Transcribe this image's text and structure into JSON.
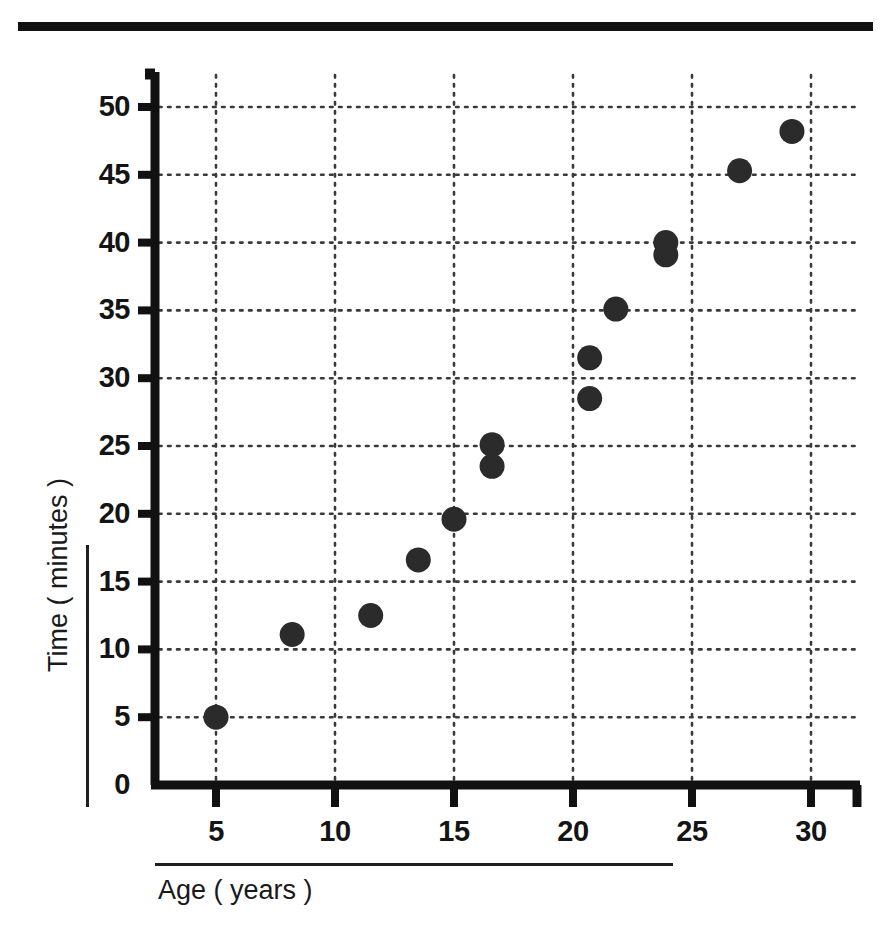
{
  "page": {
    "top_rule": "horizontal-rule"
  },
  "chart_data": {
    "type": "scatter",
    "title": "",
    "xlabel": "Age ( years )",
    "ylabel": "Time ( minutes )",
    "xlim": [
      3,
      32.5
    ],
    "ylim": [
      0,
      52.5
    ],
    "xticks": [
      5,
      10,
      15,
      20,
      25,
      30
    ],
    "yticks": [
      0,
      5,
      10,
      15,
      20,
      25,
      30,
      35,
      40,
      45,
      50
    ],
    "grid": true,
    "grid_style": "dotted",
    "legend": "none",
    "marker_color": "#2b2b2b",
    "axis_color": "#111111",
    "points": [
      {
        "x": 5.0,
        "y": 5.0
      },
      {
        "x": 8.2,
        "y": 11.1
      },
      {
        "x": 11.5,
        "y": 12.5
      },
      {
        "x": 13.5,
        "y": 16.6
      },
      {
        "x": 15.0,
        "y": 19.6
      },
      {
        "x": 16.6,
        "y": 25.1
      },
      {
        "x": 16.6,
        "y": 23.5
      },
      {
        "x": 20.7,
        "y": 28.5
      },
      {
        "x": 20.7,
        "y": 31.5
      },
      {
        "x": 21.8,
        "y": 35.1
      },
      {
        "x": 23.9,
        "y": 40.0
      },
      {
        "x": 23.9,
        "y": 39.1
      },
      {
        "x": 27.0,
        "y": 45.3
      },
      {
        "x": 29.2,
        "y": 48.2
      }
    ],
    "x": [
      5.0,
      8.2,
      11.5,
      13.5,
      15.0,
      16.6,
      16.6,
      20.7,
      20.7,
      21.8,
      23.9,
      23.9,
      27.0,
      29.2
    ],
    "values": [
      5.0,
      11.1,
      12.5,
      16.6,
      19.6,
      25.1,
      23.5,
      28.5,
      31.5,
      35.1,
      40.0,
      39.1,
      45.3,
      48.2
    ]
  }
}
